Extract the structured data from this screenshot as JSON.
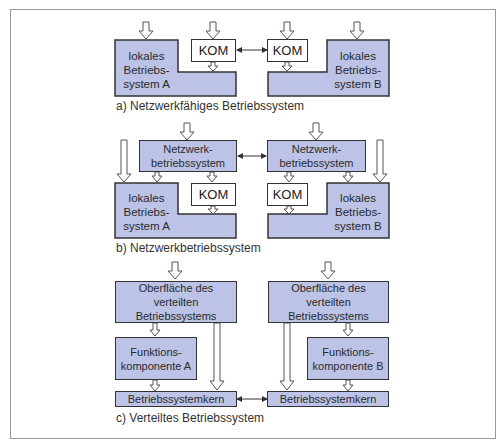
{
  "diagram": {
    "colors": {
      "block_fill": "#bcc3e6",
      "border": "#333333",
      "frame": "#9a9a9a"
    },
    "section_a": {
      "caption": "a) Netzwerkfähiges Betriebssystem",
      "left_os": "lokales\nBetriebs-\nsystem A",
      "right_os": "lokales\nBetriebs-\nsystem B",
      "left_kom": "KOM",
      "right_kom": "KOM"
    },
    "section_b": {
      "caption": "b) Netzwerkbetriebssystem",
      "left_nos": "Netzwerk-\nbetriebssystem",
      "right_nos": "Netzwerk-\nbetriebssystem",
      "left_os": "lokales\nBetriebs-\nsystem A",
      "right_os": "lokales\nBetriebs-\nsystem B",
      "left_kom": "KOM",
      "right_kom": "KOM"
    },
    "section_c": {
      "caption": "c) Verteiltes Betriebssystem",
      "left_surface": "Oberfläche des\nverteilten\nBetriebssystems",
      "right_surface": "Oberfläche des\nverteilten\nBetriebssystems",
      "left_component": "Funktions-\nkomponente A",
      "right_component": "Funktions-\nkomponente B",
      "left_kernel": "Betriebssystemkern",
      "right_kernel": "Betriebssystemkern"
    }
  }
}
